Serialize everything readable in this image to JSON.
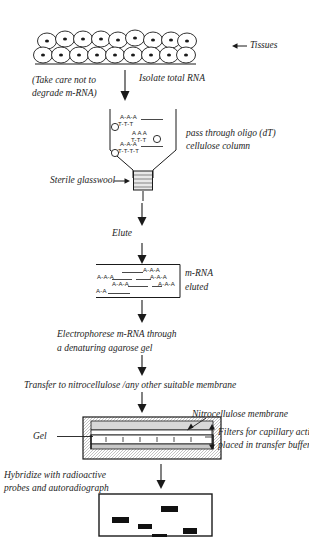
{
  "figure": {
    "ink_color": "#1a1a1a",
    "paper_color": "#ffffff"
  },
  "steps": {
    "tissues_label": "Tissues",
    "caution_line1": "(Take care not to",
    "caution_line2": "degrade m-RNA)",
    "isolate_label": "Isolate total RNA",
    "column_line1": "pass through oligo (dT)",
    "column_line2": "cellulose column",
    "glasswool_label": "Sterile glasswool",
    "elute_label": "Elute",
    "mrna_line1": "m-RNA",
    "mrna_line2": "eluted",
    "electrophorese_line1": "Electrophorese m-RNA through",
    "electrophorese_line2": "a denaturing agarose gel",
    "transfer_label": "Transfer to nitrocellulose /any other suitable membrane",
    "membrane_label": "Nitrocellulose membrane",
    "filters_line1": "Filters for capillary action",
    "filters_line2": "placed in transfer buffer",
    "gel_label": "Gel",
    "hybridize_line1": "Hybridize with radioactive",
    "hybridize_line2": "probes and autoradiograph"
  },
  "sequences": {
    "poly_a": "A-A-A",
    "oligo_dt": "T-T-T",
    "oligo_dt_long": "T-T-T-T"
  },
  "column_strands": [
    {
      "a": "A-A-A",
      "t": "T-T-T"
    },
    {
      "a": "A A A",
      "t": "T-T-T"
    },
    {
      "a": "A-A-A",
      "t": "T-T-T-T"
    }
  ],
  "eluted_strands": [
    {
      "label": "A-A-A"
    },
    {
      "label": "A-A-A"
    },
    {
      "label": "A-A-A"
    },
    {
      "label": "A-A-A"
    },
    {
      "label": "A-A-A"
    },
    {
      "label": "A-A-A"
    },
    {
      "label": "A-A"
    }
  ],
  "autoradiograph": {
    "band_count": 5,
    "bands": [
      {
        "x": 14,
        "y": 24,
        "w": 17,
        "h": 6
      },
      {
        "x": 40,
        "y": 31,
        "w": 14,
        "h": 5
      },
      {
        "x": 63,
        "y": 13,
        "w": 17,
        "h": 6
      },
      {
        "x": 54,
        "y": 41,
        "w": 15,
        "h": 6
      },
      {
        "x": 85,
        "y": 35,
        "w": 14,
        "h": 6
      }
    ]
  }
}
